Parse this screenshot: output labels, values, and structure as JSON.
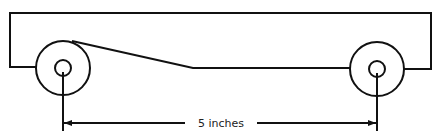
{
  "diagram": {
    "type": "vehicle-wheelbase-schematic",
    "stroke_color": "#111111",
    "background": "#ffffff",
    "dimension": {
      "label": "5 inches",
      "measures": "distance between wheel axles"
    },
    "parts": [
      {
        "name": "body",
        "description": "rectangular car body outline with sloped underside"
      },
      {
        "name": "left-wheel",
        "description": "front wheel with axle hole"
      },
      {
        "name": "right-wheel",
        "description": "rear wheel with axle hole"
      },
      {
        "name": "dimension-line",
        "description": "double-headed arrow spanning axle to axle"
      }
    ]
  }
}
